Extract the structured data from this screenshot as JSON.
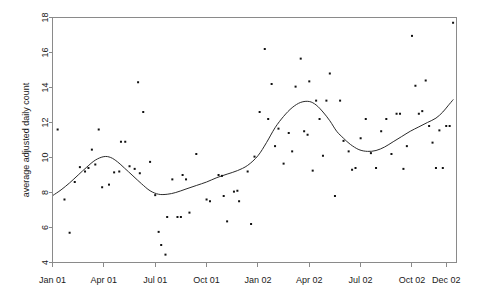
{
  "chart_data": {
    "type": "scatter",
    "title": "",
    "subtitle": "",
    "xlabel": "",
    "ylabel": "average adjusted daily count",
    "grid": false,
    "legend": null,
    "box_frame": true,
    "ylim": [
      4,
      18
    ],
    "yticks": [
      4,
      6,
      8,
      10,
      12,
      14,
      16,
      18
    ],
    "ytick_labels": [
      "4",
      "6",
      "8",
      "10",
      "12",
      "14",
      "16",
      "18"
    ],
    "xlim": [
      "2001-01-01",
      "2002-12-31"
    ],
    "xticks": [
      "Jan 01",
      "Apr 01",
      "Jul 01",
      "Oct 01",
      "Jan 02",
      "Apr 02",
      "Jul 02",
      "Oct 02",
      "Dec 02"
    ],
    "xtick_positions_months": [
      0,
      3,
      6,
      9,
      12,
      15,
      18,
      21,
      23
    ],
    "marker": "point",
    "marker_color": "#111111",
    "line_color": "#2b2b2b",
    "series": [
      {
        "name": "observations",
        "type": "scatter",
        "points": [
          {
            "x": 0.3,
            "y": 11.6
          },
          {
            "x": 0.7,
            "y": 7.6
          },
          {
            "x": 1.0,
            "y": 5.7
          },
          {
            "x": 1.3,
            "y": 8.6
          },
          {
            "x": 1.6,
            "y": 9.45
          },
          {
            "x": 1.9,
            "y": 9.2
          },
          {
            "x": 2.1,
            "y": 9.4
          },
          {
            "x": 2.3,
            "y": 10.45
          },
          {
            "x": 2.5,
            "y": 9.6
          },
          {
            "x": 2.7,
            "y": 11.6
          },
          {
            "x": 2.9,
            "y": 8.3
          },
          {
            "x": 3.3,
            "y": 8.45
          },
          {
            "x": 3.6,
            "y": 9.15
          },
          {
            "x": 3.9,
            "y": 9.2
          },
          {
            "x": 4.0,
            "y": 10.9
          },
          {
            "x": 4.25,
            "y": 10.9
          },
          {
            "x": 4.5,
            "y": 9.5
          },
          {
            "x": 4.8,
            "y": 9.35
          },
          {
            "x": 5.0,
            "y": 14.3
          },
          {
            "x": 5.1,
            "y": 9.1
          },
          {
            "x": 5.3,
            "y": 12.6
          },
          {
            "x": 5.7,
            "y": 9.75
          },
          {
            "x": 6.0,
            "y": 7.85
          },
          {
            "x": 6.2,
            "y": 5.75
          },
          {
            "x": 6.35,
            "y": 5.0
          },
          {
            "x": 6.6,
            "y": 4.45
          },
          {
            "x": 6.7,
            "y": 6.6
          },
          {
            "x": 7.0,
            "y": 8.75
          },
          {
            "x": 7.3,
            "y": 6.6
          },
          {
            "x": 7.5,
            "y": 6.6
          },
          {
            "x": 7.6,
            "y": 9.0
          },
          {
            "x": 7.8,
            "y": 8.75
          },
          {
            "x": 8.0,
            "y": 6.85
          },
          {
            "x": 8.4,
            "y": 10.2
          },
          {
            "x": 9.0,
            "y": 7.6
          },
          {
            "x": 9.2,
            "y": 7.5
          },
          {
            "x": 9.7,
            "y": 9.0
          },
          {
            "x": 9.9,
            "y": 8.95
          },
          {
            "x": 10.0,
            "y": 7.8
          },
          {
            "x": 10.2,
            "y": 6.35
          },
          {
            "x": 10.6,
            "y": 8.05
          },
          {
            "x": 10.8,
            "y": 8.1
          },
          {
            "x": 10.9,
            "y": 7.5
          },
          {
            "x": 11.4,
            "y": 9.2
          },
          {
            "x": 11.6,
            "y": 6.2
          },
          {
            "x": 11.8,
            "y": 10.05
          },
          {
            "x": 12.1,
            "y": 12.6
          },
          {
            "x": 12.4,
            "y": 16.2
          },
          {
            "x": 12.6,
            "y": 12.2
          },
          {
            "x": 12.8,
            "y": 14.2
          },
          {
            "x": 13.0,
            "y": 10.65
          },
          {
            "x": 13.2,
            "y": 11.65
          },
          {
            "x": 13.5,
            "y": 9.65
          },
          {
            "x": 13.8,
            "y": 11.4
          },
          {
            "x": 14.0,
            "y": 10.35
          },
          {
            "x": 14.2,
            "y": 14.05
          },
          {
            "x": 14.5,
            "y": 15.65
          },
          {
            "x": 14.7,
            "y": 11.5
          },
          {
            "x": 14.9,
            "y": 11.3
          },
          {
            "x": 15.0,
            "y": 14.35
          },
          {
            "x": 15.2,
            "y": 9.25
          },
          {
            "x": 15.4,
            "y": 13.25
          },
          {
            "x": 15.6,
            "y": 12.2
          },
          {
            "x": 15.8,
            "y": 10.1
          },
          {
            "x": 16.0,
            "y": 13.25
          },
          {
            "x": 16.2,
            "y": 14.8
          },
          {
            "x": 16.5,
            "y": 7.8
          },
          {
            "x": 16.8,
            "y": 13.25
          },
          {
            "x": 17.0,
            "y": 10.95
          },
          {
            "x": 17.3,
            "y": 10.35
          },
          {
            "x": 17.5,
            "y": 9.3
          },
          {
            "x": 17.7,
            "y": 9.4
          },
          {
            "x": 18.0,
            "y": 11.1
          },
          {
            "x": 18.3,
            "y": 12.2
          },
          {
            "x": 18.6,
            "y": 10.25
          },
          {
            "x": 18.9,
            "y": 9.4
          },
          {
            "x": 19.2,
            "y": 11.5
          },
          {
            "x": 19.5,
            "y": 12.2
          },
          {
            "x": 19.8,
            "y": 10.2
          },
          {
            "x": 20.1,
            "y": 12.5
          },
          {
            "x": 20.3,
            "y": 12.5
          },
          {
            "x": 20.5,
            "y": 9.35
          },
          {
            "x": 20.7,
            "y": 10.65
          },
          {
            "x": 21.0,
            "y": 16.95
          },
          {
            "x": 21.2,
            "y": 14.1
          },
          {
            "x": 21.4,
            "y": 12.5
          },
          {
            "x": 21.6,
            "y": 12.65
          },
          {
            "x": 21.8,
            "y": 14.4
          },
          {
            "x": 22.0,
            "y": 11.8
          },
          {
            "x": 22.2,
            "y": 10.85
          },
          {
            "x": 22.4,
            "y": 9.4
          },
          {
            "x": 22.6,
            "y": 11.55
          },
          {
            "x": 22.8,
            "y": 9.4
          },
          {
            "x": 23.0,
            "y": 11.8
          },
          {
            "x": 23.2,
            "y": 11.8
          },
          {
            "x": 23.4,
            "y": 17.7
          }
        ]
      },
      {
        "name": "smoothed-fit",
        "type": "line",
        "points": [
          {
            "x": 0.05,
            "y": 7.85
          },
          {
            "x": 0.5,
            "y": 8.15
          },
          {
            "x": 1.0,
            "y": 8.55
          },
          {
            "x": 1.5,
            "y": 9.0
          },
          {
            "x": 2.0,
            "y": 9.45
          },
          {
            "x": 2.5,
            "y": 9.85
          },
          {
            "x": 3.0,
            "y": 10.05
          },
          {
            "x": 3.4,
            "y": 10.0
          },
          {
            "x": 3.8,
            "y": 9.75
          },
          {
            "x": 4.2,
            "y": 9.4
          },
          {
            "x": 4.7,
            "y": 8.95
          },
          {
            "x": 5.2,
            "y": 8.5
          },
          {
            "x": 5.7,
            "y": 8.1
          },
          {
            "x": 6.2,
            "y": 7.9
          },
          {
            "x": 6.7,
            "y": 7.9
          },
          {
            "x": 7.2,
            "y": 8.0
          },
          {
            "x": 7.8,
            "y": 8.2
          },
          {
            "x": 8.4,
            "y": 8.4
          },
          {
            "x": 9.0,
            "y": 8.6
          },
          {
            "x": 9.6,
            "y": 8.85
          },
          {
            "x": 10.2,
            "y": 9.05
          },
          {
            "x": 10.8,
            "y": 9.25
          },
          {
            "x": 11.4,
            "y": 9.55
          },
          {
            "x": 12.0,
            "y": 10.1
          },
          {
            "x": 12.5,
            "y": 10.85
          },
          {
            "x": 13.0,
            "y": 11.7
          },
          {
            "x": 13.5,
            "y": 12.35
          },
          {
            "x": 14.0,
            "y": 12.85
          },
          {
            "x": 14.5,
            "y": 13.15
          },
          {
            "x": 15.0,
            "y": 13.2
          },
          {
            "x": 15.4,
            "y": 13.0
          },
          {
            "x": 15.8,
            "y": 12.6
          },
          {
            "x": 16.2,
            "y": 12.1
          },
          {
            "x": 16.6,
            "y": 11.5
          },
          {
            "x": 17.0,
            "y": 11.1
          },
          {
            "x": 17.4,
            "y": 10.75
          },
          {
            "x": 17.9,
            "y": 10.45
          },
          {
            "x": 18.4,
            "y": 10.35
          },
          {
            "x": 18.9,
            "y": 10.4
          },
          {
            "x": 19.4,
            "y": 10.6
          },
          {
            "x": 19.9,
            "y": 10.9
          },
          {
            "x": 20.4,
            "y": 11.2
          },
          {
            "x": 20.9,
            "y": 11.5
          },
          {
            "x": 21.4,
            "y": 11.75
          },
          {
            "x": 21.9,
            "y": 12.0
          },
          {
            "x": 22.4,
            "y": 12.25
          },
          {
            "x": 22.8,
            "y": 12.6
          },
          {
            "x": 23.1,
            "y": 12.95
          },
          {
            "x": 23.4,
            "y": 13.3
          }
        ]
      }
    ]
  },
  "axes": {
    "y_title": "average adjusted daily count"
  }
}
